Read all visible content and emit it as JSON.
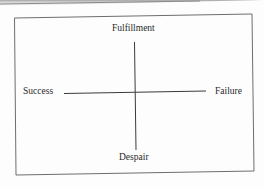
{
  "diagram": {
    "type": "quadrant-axes",
    "axes": {
      "vertical": {
        "top_label": "Fulfillment",
        "bottom_label": "Despair"
      },
      "horizontal": {
        "left_label": "Success",
        "right_label": "Failure"
      }
    },
    "colors": {
      "line": "#3a3a3a",
      "border": "#6e6e6e",
      "text": "#2a2a2a",
      "background": "#fdfdfd"
    }
  }
}
